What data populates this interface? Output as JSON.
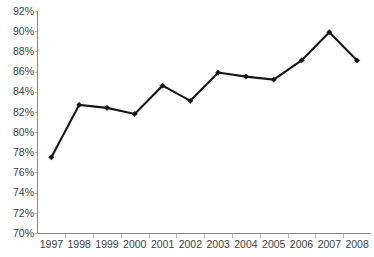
{
  "chart_data": {
    "type": "line",
    "title": "",
    "subtitle": "",
    "xlabel": "",
    "ylabel": "",
    "categories": [
      "1997",
      "1998",
      "1999",
      "2000",
      "2001",
      "2002",
      "2003",
      "2004",
      "2005",
      "2006",
      "2007",
      "2008"
    ],
    "values": [
      77.5,
      82.7,
      82.4,
      81.8,
      84.6,
      83.1,
      85.9,
      85.5,
      85.2,
      87.1,
      89.9,
      87.1
    ],
    "series": [
      {
        "name": "",
        "values": [
          77.5,
          82.7,
          82.4,
          81.8,
          84.6,
          83.1,
          85.9,
          85.5,
          85.2,
          87.1,
          89.9,
          87.1
        ]
      }
    ],
    "ylim": [
      70,
      92
    ],
    "ytick_step": 2,
    "ytick_labels": [
      "70%",
      "72%",
      "74%",
      "76%",
      "78%",
      "80%",
      "82%",
      "84%",
      "86%",
      "88%",
      "90%",
      "92%"
    ],
    "ytick_values": [
      70,
      72,
      74,
      76,
      78,
      80,
      82,
      84,
      86,
      88,
      90,
      92
    ],
    "xtick_labels": [
      "1997",
      "1998",
      "1999",
      "2000",
      "2001",
      "2002",
      "2003",
      "2004",
      "2005",
      "2006",
      "2007",
      "2008"
    ],
    "grid": false,
    "legend": false,
    "legend_position": "none",
    "marker": "diamond",
    "line_color": "#161616",
    "marker_color": "#161616",
    "axis_color": "#8a8a8a",
    "tick_color": "#b4b4b4",
    "label_color": "#3d3d3d",
    "background_color": "#ffffff"
  }
}
